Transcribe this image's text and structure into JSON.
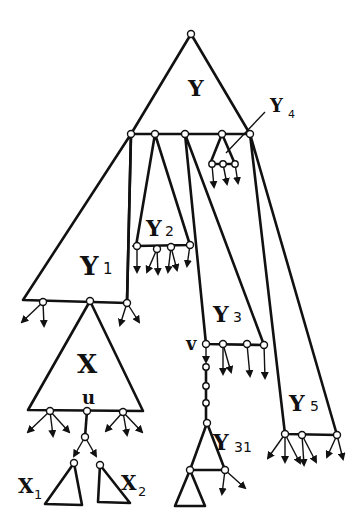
{
  "diagram": {
    "labels": {
      "Y": {
        "main": "Y",
        "sub": ""
      },
      "Y1": {
        "main": "Y",
        "sub": "1"
      },
      "Y2": {
        "main": "Y",
        "sub": "2"
      },
      "Y3": {
        "main": "Y",
        "sub": "3"
      },
      "Y4": {
        "main": "Y",
        "sub": "4"
      },
      "Y5": {
        "main": "Y",
        "sub": "5"
      },
      "Y31": {
        "main": "Y",
        "sub": "31"
      },
      "X": {
        "main": "X",
        "sub": ""
      },
      "X1": {
        "main": "X",
        "sub": "1"
      },
      "X2": {
        "main": "X",
        "sub": "2"
      },
      "u": {
        "main": "u",
        "sub": ""
      },
      "v": {
        "main": "v",
        "sub": ""
      }
    },
    "colors": {
      "stroke": "#111111",
      "background": "#ffffff",
      "node_fill": "#ffffff"
    }
  }
}
